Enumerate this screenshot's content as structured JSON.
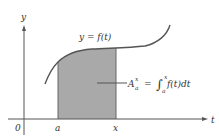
{
  "figure": {
    "axes": {
      "y_label": "y",
      "x_label": "t",
      "origin_label": "0"
    },
    "ticks": {
      "a_label": "a",
      "x_label": "x"
    },
    "curve_label": "y = f(t)",
    "area_label": {
      "lhs_base": "A",
      "lhs_sub": "a",
      "lhs_sup": "x",
      "equals": "=",
      "integral_sign": "∫",
      "int_lower": "a",
      "int_upper": "x",
      "integrand": "f(t)dt"
    },
    "colors": {
      "shade": "#a9a9a9",
      "curve": "#555555",
      "axis": "#555555",
      "text": "#333333"
    }
  }
}
